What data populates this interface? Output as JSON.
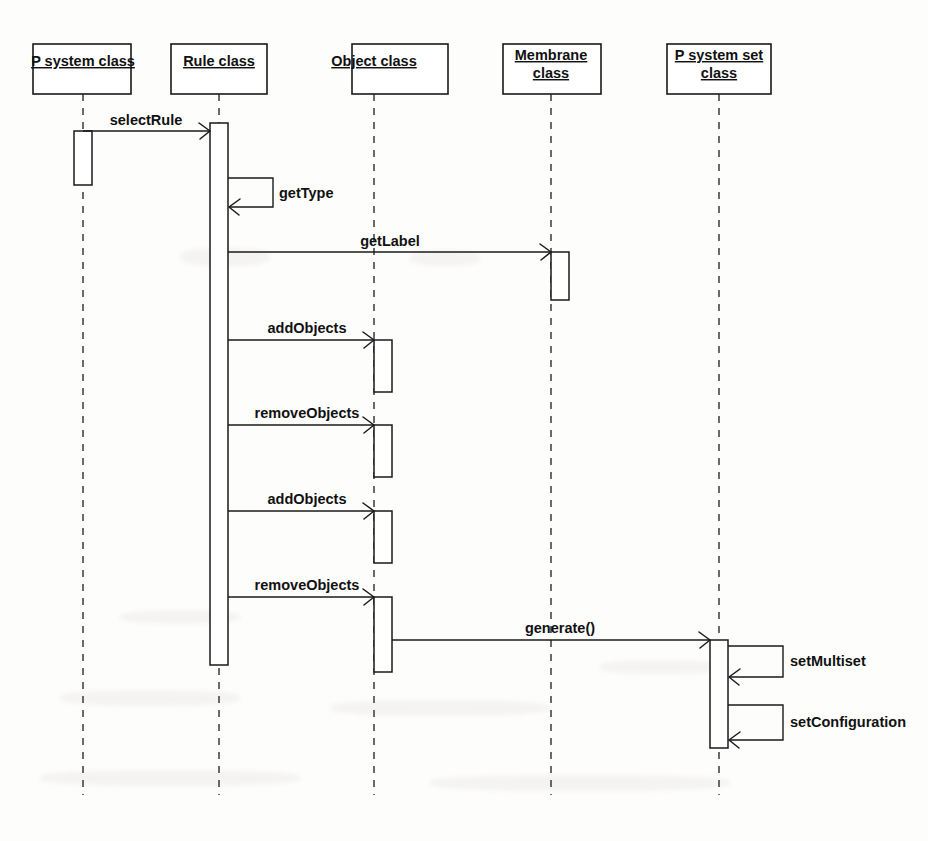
{
  "diagram": {
    "type": "uml-sequence-diagram",
    "title": "",
    "width": 928,
    "height": 841,
    "background_color": "#fdfdfc",
    "line_color": "#1a1a1a",
    "lifelines": [
      {
        "id": "p-system-class",
        "label": "P system class",
        "label_lines": [
          "P system class"
        ],
        "center_x": 83,
        "box": {
          "x": 33,
          "y": 44,
          "width": 98,
          "height": 50
        }
      },
      {
        "id": "rule-class",
        "label": "Rule class",
        "label_lines": [
          "Rule class"
        ],
        "center_x": 219,
        "box": {
          "x": 171,
          "y": 44,
          "width": 96,
          "height": 50
        }
      },
      {
        "id": "object-class",
        "label": "Object class",
        "label_lines": [
          "Object class"
        ],
        "center_x": 374,
        "box": {
          "x": 352,
          "y": 44,
          "width": 96,
          "height": 50
        }
      },
      {
        "id": "membrane-class",
        "label": "Membrane class",
        "label_lines": [
          "Membrane",
          "class"
        ],
        "center_x": 551,
        "box": {
          "x": 503,
          "y": 44,
          "width": 98,
          "height": 50
        }
      },
      {
        "id": "p-system-set-class",
        "label": "P system set class",
        "label_lines": [
          "P system set",
          "class"
        ],
        "center_x": 719,
        "box": {
          "x": 667,
          "y": 44,
          "width": 104,
          "height": 50
        }
      }
    ],
    "activations": [
      {
        "id": "act-p-system",
        "lifeline": "p-system-class",
        "x": 74,
        "y": 131,
        "width": 18,
        "height": 54
      },
      {
        "id": "act-rule",
        "lifeline": "rule-class",
        "x": 210,
        "y": 123,
        "width": 18,
        "height": 542
      },
      {
        "id": "act-membrane-getlabel",
        "lifeline": "membrane-class",
        "x": 551,
        "y": 252,
        "width": 18,
        "height": 48
      },
      {
        "id": "act-object-add-1",
        "lifeline": "object-class",
        "x": 374,
        "y": 340,
        "width": 18,
        "height": 52
      },
      {
        "id": "act-object-remove-1",
        "lifeline": "object-class",
        "x": 374,
        "y": 425,
        "width": 18,
        "height": 52
      },
      {
        "id": "act-object-add-2",
        "lifeline": "object-class",
        "x": 374,
        "y": 511,
        "width": 18,
        "height": 52
      },
      {
        "id": "act-object-remove-2",
        "lifeline": "object-class",
        "x": 374,
        "y": 597,
        "width": 18,
        "height": 75
      },
      {
        "id": "act-p-system-set",
        "lifeline": "p-system-set-class",
        "x": 710,
        "y": 640,
        "width": 18,
        "height": 108
      }
    ],
    "messages": [
      {
        "id": "msg-select-rule",
        "label": "selectRule",
        "kind": "call",
        "from": "p-system-class",
        "to": "rule-class",
        "from_x": 83,
        "to_x": 210,
        "y": 131,
        "label_x": 146,
        "label_y": 125,
        "direction": "right"
      },
      {
        "id": "msg-get-type",
        "label": "getType",
        "kind": "self-call",
        "from": "rule-class",
        "to": "rule-class",
        "from_x": 228,
        "to_x": 228,
        "y": 178,
        "return_y": 207,
        "loop_x": 273,
        "label_x": 279,
        "label_y": 198,
        "direction": "self"
      },
      {
        "id": "msg-get-label",
        "label": "getLabel",
        "kind": "call",
        "from": "rule-class",
        "to": "membrane-class",
        "from_x": 228,
        "to_x": 551,
        "y": 252,
        "label_x": 390,
        "label_y": 246,
        "direction": "right"
      },
      {
        "id": "msg-add-objects-1",
        "label": "addObjects",
        "kind": "call",
        "from": "rule-class",
        "to": "object-class",
        "from_x": 228,
        "to_x": 374,
        "y": 340,
        "label_x": 307,
        "label_y": 333,
        "direction": "right"
      },
      {
        "id": "msg-remove-objects-1",
        "label": "removeObjects",
        "kind": "call",
        "from": "rule-class",
        "to": "object-class",
        "from_x": 228,
        "to_x": 374,
        "y": 425,
        "label_x": 307,
        "label_y": 418,
        "direction": "right"
      },
      {
        "id": "msg-add-objects-2",
        "label": "addObjects",
        "kind": "call",
        "from": "rule-class",
        "to": "object-class",
        "from_x": 228,
        "to_x": 374,
        "y": 511,
        "label_x": 307,
        "label_y": 504,
        "direction": "right"
      },
      {
        "id": "msg-remove-objects-2",
        "label": "removeObjects",
        "kind": "call",
        "from": "rule-class",
        "to": "object-class",
        "from_x": 228,
        "to_x": 374,
        "y": 597,
        "label_x": 307,
        "label_y": 590,
        "direction": "right"
      },
      {
        "id": "msg-generate",
        "label": "generate()",
        "kind": "call",
        "from": "object-class",
        "to": "p-system-set-class",
        "from_x": 392,
        "to_x": 710,
        "y": 640,
        "label_x": 560,
        "label_y": 633,
        "direction": "right"
      },
      {
        "id": "msg-set-multiset",
        "label": "setMultiset",
        "kind": "self-call",
        "from": "p-system-set-class",
        "to": "p-system-set-class",
        "from_x": 728,
        "to_x": 728,
        "y": 646,
        "return_y": 677,
        "loop_x": 783,
        "label_x": 790,
        "label_y": 666,
        "direction": "self"
      },
      {
        "id": "msg-set-configuration",
        "label": "setConfiguration",
        "kind": "self-call",
        "from": "p-system-set-class",
        "to": "p-system-set-class",
        "from_x": 728,
        "to_x": 728,
        "y": 705,
        "return_y": 740,
        "loop_x": 783,
        "label_x": 790,
        "label_y": 727,
        "direction": "self"
      }
    ],
    "lifeline_bottom_y": 795,
    "lifeline_top_y": 94
  }
}
